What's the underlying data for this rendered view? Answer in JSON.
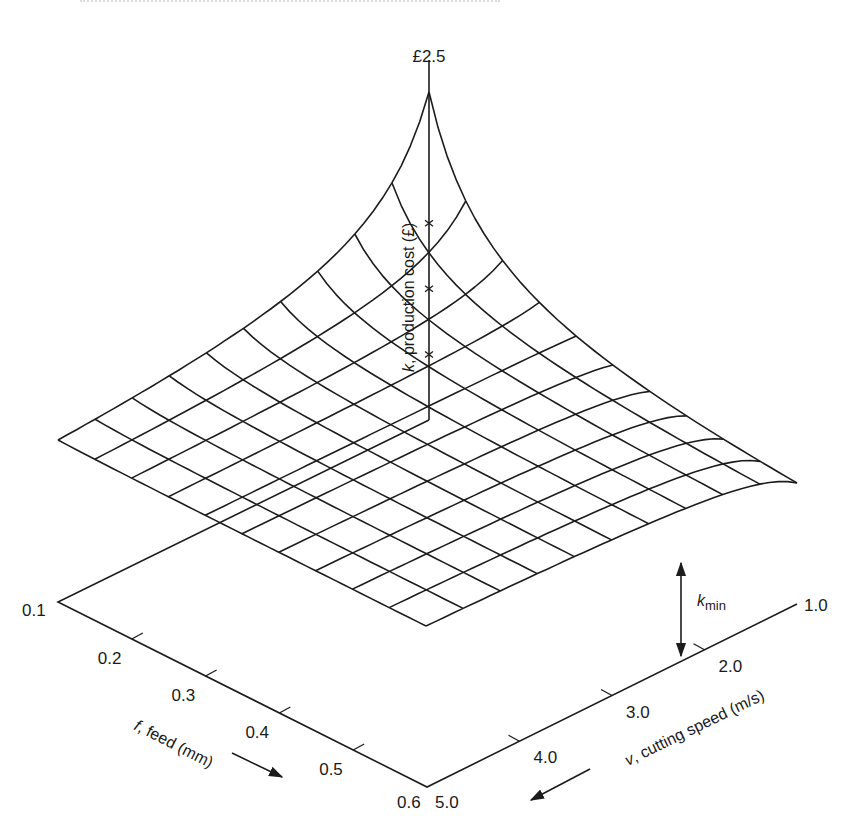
{
  "chart_data": {
    "type": "surface3d",
    "title": "",
    "zlabel": "k, production cost (£)",
    "zlabel_var": "k",
    "zlabel_rest": ", production cost (£)",
    "ztop_label": "£2.5",
    "zmax": 2.5,
    "xlabel": "f, feed (mm)",
    "xlabel_var": "f",
    "xlabel_rest": ", feed (mm)",
    "ylabel": "v, cutting speed (m/s)",
    "ylabel_var": "v",
    "ylabel_rest": ", cutting speed (m/s)",
    "feed_ticks": [
      "0.1",
      "0.2",
      "0.3",
      "0.4",
      "0.5",
      "0.6"
    ],
    "feed_range": [
      0.1,
      0.6
    ],
    "speed_ticks": [
      "1.0",
      "2.0",
      "3.0",
      "4.0",
      "5.0"
    ],
    "speed_range": [
      1.0,
      5.0
    ],
    "annotation": {
      "label_var": "k",
      "label_sub": "min",
      "text": "k_min"
    },
    "mesh_divisions": 10,
    "surface_points_px": {
      "apex": [
        429,
        92
      ],
      "left_corner": [
        57,
        440
      ],
      "right_corner": [
        799,
        483
      ],
      "front_corner": [
        430,
        627
      ]
    },
    "z_axis_marks": [
      1.5,
      1.0,
      0.5
    ],
    "grid": false,
    "legend": null
  },
  "figure": {
    "base": {
      "back": [
        429,
        420
      ],
      "left": [
        58,
        602
      ],
      "right": [
        797,
        604
      ],
      "front": [
        427,
        787
      ]
    },
    "kmin_arrow": {
      "x": 681,
      "y_top": 561,
      "y_bottom": 658
    }
  }
}
